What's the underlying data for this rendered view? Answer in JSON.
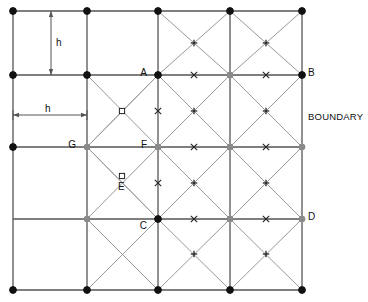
{
  "diagram": {
    "title": "",
    "boundary_label": "BOUNDARY",
    "spacing_label_vertical": "h",
    "spacing_label_horizontal": "h",
    "colors": {
      "grid_line": "#555555",
      "diagonal_line": "#999999",
      "node_fill": "#111111",
      "node_open_fill": "#8a8a8a",
      "marker": "#222222",
      "text": "#111111",
      "background": "#ffffff"
    },
    "geometry": {
      "x_coords": [
        13,
        87,
        158,
        230,
        302
      ],
      "y_coords": [
        11,
        75,
        147,
        219,
        290
      ],
      "cell_h": 72
    },
    "point_labels": [
      {
        "id": "A",
        "text": "A",
        "x": 147,
        "y": 68,
        "anchor": "end"
      },
      {
        "id": "B",
        "text": "B",
        "x": 308,
        "y": 68,
        "anchor": "start"
      },
      {
        "id": "C",
        "text": "C",
        "x": 147,
        "y": 221,
        "anchor": "end"
      },
      {
        "id": "D",
        "text": "D",
        "x": 308,
        "y": 212,
        "anchor": "start"
      },
      {
        "id": "E",
        "text": "E",
        "x": 118,
        "y": 182,
        "anchor": "start"
      },
      {
        "id": "F",
        "text": "F",
        "x": 147,
        "y": 140,
        "anchor": "end"
      },
      {
        "id": "G",
        "text": "G",
        "x": 76,
        "y": 140,
        "anchor": "end"
      }
    ],
    "markers": [
      {
        "type": "x",
        "x": 194,
        "y": 75
      },
      {
        "type": "x",
        "x": 266,
        "y": 75
      },
      {
        "type": "x",
        "x": 194,
        "y": 147
      },
      {
        "type": "x",
        "x": 266,
        "y": 147
      },
      {
        "type": "x",
        "x": 194,
        "y": 219
      },
      {
        "type": "x",
        "x": 266,
        "y": 219
      },
      {
        "type": "x",
        "x": 158,
        "y": 111
      },
      {
        "type": "x",
        "x": 158,
        "y": 183
      },
      {
        "type": "plus",
        "x": 194,
        "y": 43
      },
      {
        "type": "plus",
        "x": 266,
        "y": 43
      },
      {
        "type": "plus",
        "x": 194,
        "y": 111
      },
      {
        "type": "plus",
        "x": 266,
        "y": 111
      },
      {
        "type": "plus",
        "x": 194,
        "y": 183
      },
      {
        "type": "plus",
        "x": 266,
        "y": 183
      },
      {
        "type": "plus",
        "x": 194,
        "y": 254
      },
      {
        "type": "plus",
        "x": 266,
        "y": 254
      },
      {
        "type": "square",
        "x": 122,
        "y": 111
      },
      {
        "type": "square",
        "x": 122,
        "y": 176
      }
    ],
    "nodes_filled": [
      {
        "x": 13,
        "y": 11
      },
      {
        "x": 87,
        "y": 11
      },
      {
        "x": 158,
        "y": 11
      },
      {
        "x": 230,
        "y": 11
      },
      {
        "x": 302,
        "y": 11
      },
      {
        "x": 13,
        "y": 75
      },
      {
        "x": 87,
        "y": 75
      },
      {
        "x": 158,
        "y": 75
      },
      {
        "x": 302,
        "y": 75
      },
      {
        "x": 13,
        "y": 147
      },
      {
        "x": 158,
        "y": 219
      },
      {
        "x": 13,
        "y": 290
      },
      {
        "x": 87,
        "y": 290
      },
      {
        "x": 158,
        "y": 290
      },
      {
        "x": 230,
        "y": 290
      },
      {
        "x": 302,
        "y": 290
      }
    ],
    "nodes_open": [
      {
        "x": 230,
        "y": 75
      },
      {
        "x": 87,
        "y": 147
      },
      {
        "x": 158,
        "y": 147
      },
      {
        "x": 230,
        "y": 147
      },
      {
        "x": 302,
        "y": 147
      },
      {
        "x": 87,
        "y": 219
      },
      {
        "x": 230,
        "y": 219
      },
      {
        "x": 302,
        "y": 219
      }
    ],
    "dimension_vertical": {
      "label": "h",
      "x": 51,
      "y_top": 11,
      "y_bottom": 75,
      "label_x": 56,
      "label_y": 38
    },
    "dimension_horizontal": {
      "label": "h",
      "y": 115,
      "x_left": 13,
      "x_right": 87,
      "label_x": 45,
      "label_y": 104
    }
  }
}
